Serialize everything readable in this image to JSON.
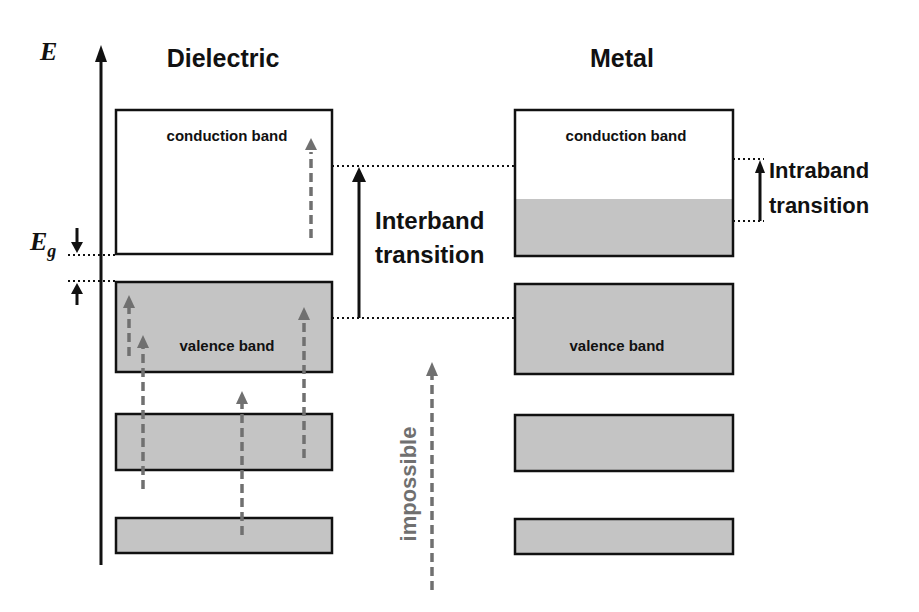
{
  "axis": {
    "label": "E",
    "gap_label_main": "E",
    "gap_label_sub": "g"
  },
  "columns": {
    "dielectric": {
      "title": "Dielectric"
    },
    "metal": {
      "title": "Metal"
    }
  },
  "bands": {
    "dielectric_conduction": "conduction band",
    "dielectric_valence": "valence band",
    "metal_conduction": "conduction band",
    "metal_valence": "valence band"
  },
  "transitions": {
    "interband_line1": "Interband",
    "interband_line2": "transition",
    "intraband_line1": "Intraband",
    "intraband_line2": "transition",
    "impossible": "impossible"
  },
  "colors": {
    "band_fill": "#c4c4c4",
    "outline": "#111111",
    "dashed_arrow": "#707070"
  }
}
